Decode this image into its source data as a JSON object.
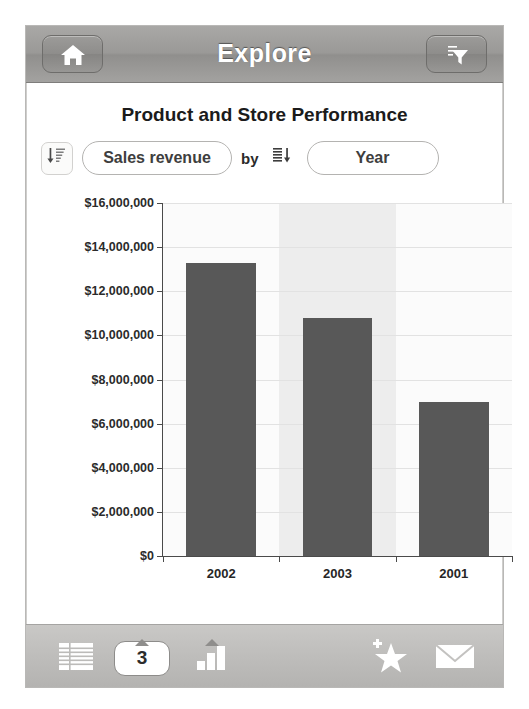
{
  "header": {
    "title": "Explore",
    "home_icon": "home-icon",
    "filter_icon": "filter-funnel-icon"
  },
  "chart_card": {
    "title": "Product and Store Performance",
    "controls": {
      "sort_measure_icon": "sort-descending-icon",
      "measure_label": "Sales revenue",
      "by_label": "by",
      "sort_dimension_icon": "sort-list-descending-icon",
      "dimension_label": "Year"
    }
  },
  "chart_data": {
    "type": "bar",
    "title": "Product and Store Performance",
    "categories": [
      "2002",
      "2003",
      "2001"
    ],
    "values": [
      13300000,
      10800000,
      7000000
    ],
    "series": [
      {
        "name": "Sales revenue",
        "values": [
          13300000,
          10800000,
          7000000
        ]
      }
    ],
    "xlabel": "Year",
    "ylabel": "Sales revenue",
    "ylim": [
      0,
      16000000
    ],
    "ytick_values": [
      0,
      2000000,
      4000000,
      6000000,
      8000000,
      10000000,
      12000000,
      14000000,
      16000000
    ],
    "ytick_labels": [
      "$0",
      "$2,000,000",
      "$4,000,000",
      "$6,000,000",
      "$8,000,000",
      "$10,000,000",
      "$12,000,000",
      "$14,000,000",
      "$16,000,000"
    ],
    "grid": true,
    "legend": false,
    "bar_color": "#585858",
    "band_color": "#ededed",
    "plot_background": "#fbfbfb"
  },
  "toolbar": {
    "list_icon": "table-list-icon",
    "page_count": "3",
    "chart_icon": "bar-chart-icon",
    "favorite_icon": "add-favorite-star-icon",
    "mail_icon": "envelope-icon"
  }
}
